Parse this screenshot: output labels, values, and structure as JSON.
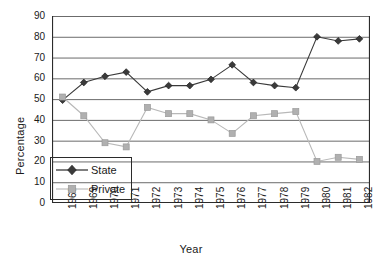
{
  "chart_data": {
    "type": "line",
    "title": "",
    "xlabel": "Year",
    "ylabel": "Percentage",
    "categories": [
      "1968",
      "1969",
      "1970",
      "1971",
      "1972",
      "1973",
      "1974",
      "1975",
      "1976",
      "1977",
      "1978",
      "1979",
      "1980",
      "1981",
      "1982"
    ],
    "ylim": [
      0,
      90
    ],
    "ytick_step": 10,
    "yticks": [
      "90",
      "80",
      "70",
      "60",
      "50",
      "40",
      "30",
      "20",
      "10",
      "0"
    ],
    "grid": "horizontal",
    "legend_position": "lower-left-inside",
    "series": [
      {
        "name": "State",
        "marker": "diamond",
        "color": "#3a3a3a",
        "line_color": "#3a3a3a",
        "values": [
          49.5,
          58,
          61,
          63,
          53.5,
          56.5,
          56.5,
          59.5,
          66.5,
          58,
          56.5,
          55.5,
          80,
          78,
          79
        ]
      },
      {
        "name": "Private",
        "marker": "square",
        "color": "#b0b0b0",
        "line_color": "#b8b8b8",
        "values": [
          51,
          42,
          29,
          27,
          46,
          43,
          43,
          40,
          33.5,
          42,
          43,
          44,
          20,
          22,
          21
        ]
      }
    ]
  },
  "legend": {
    "entries": [
      {
        "label": "State"
      },
      {
        "label": "Private"
      }
    ]
  },
  "axes": {
    "y_title": "Percentage",
    "x_title": "Year"
  }
}
